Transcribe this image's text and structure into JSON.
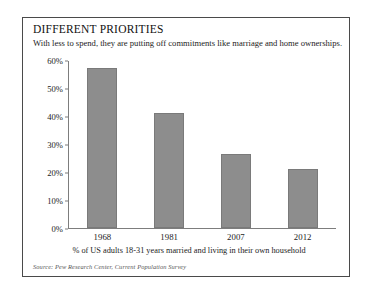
{
  "figure": {
    "title": "DIFFERENT PRIORITIES",
    "subtitle": "With less to spend, they are putting off commitments like marriage and home ownerships.",
    "caption": "% of US adults 18-31 years married and living in their own household",
    "source": "Source: Pew Research Center, Current Population Survey",
    "bar_color": "#8d8d8d",
    "border_color": "#4a4a4a"
  },
  "chart_data": {
    "type": "bar",
    "title": "DIFFERENT PRIORITIES",
    "subtitle": "With less to spend, they are putting off commitments like marriage and home ownerships.",
    "categories": [
      "1968",
      "1981",
      "2007",
      "2012"
    ],
    "values": [
      57,
      41,
      26.5,
      21
    ],
    "value_labels": [
      "57%",
      "41%",
      "26.5%",
      "21%"
    ],
    "xlabel": "% of US adults 18-31 years married and living in their own household",
    "ylabel": "",
    "ylim": [
      0,
      60
    ],
    "ytick_values": [
      60,
      50,
      40,
      30,
      20,
      10,
      0
    ],
    "ytick_labels": [
      "60%",
      "50%",
      "40%",
      "30%",
      "20%",
      "10%",
      "0%"
    ],
    "grid": false,
    "legend": "none",
    "series_color": "#8d8d8d",
    "source": "Source: Pew Research Center, Current Population Survey"
  }
}
